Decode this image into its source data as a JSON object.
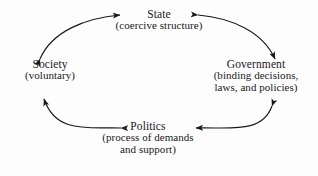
{
  "figure": {
    "background_color": "#fdfdfd",
    "ink_color": "#1a1a1a"
  },
  "nodes": {
    "state": {
      "title": "State",
      "subtitle": "(coercive structure)"
    },
    "society": {
      "title": "Society",
      "subtitle": "(voluntary)"
    },
    "government": {
      "title": "Government",
      "subtitle_line1": "(binding decisions,",
      "subtitle_line2": "laws, and policies)"
    },
    "politics": {
      "title": "Politics",
      "subtitle_line1": "(process of demands",
      "subtitle_line2": "and support)"
    }
  },
  "connectors": [
    {
      "name": "society-state",
      "from": "Society",
      "to": "State",
      "direction": "bidirectional"
    },
    {
      "name": "state-government",
      "from": "State",
      "to": "Government",
      "direction": "bidirectional"
    },
    {
      "name": "government-politics",
      "from": "Government",
      "to": "Politics",
      "direction": "bidirectional"
    },
    {
      "name": "politics-society",
      "from": "Politics",
      "to": "Society",
      "direction": "bidirectional"
    }
  ]
}
